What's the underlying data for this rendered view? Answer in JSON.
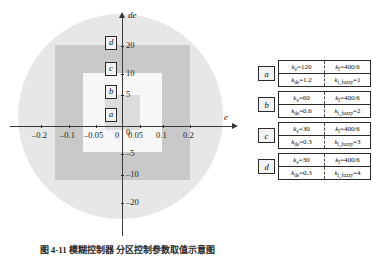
{
  "chart_data": {
    "type": "scatter",
    "title": "",
    "xlabel": "e",
    "ylabel": "de",
    "xlim": [
      -0.25,
      0.25
    ],
    "ylim": [
      -25,
      25
    ],
    "grid": false,
    "legend_position": "right",
    "x_ticks": [
      "-0.2",
      "-0.1",
      "-0.05",
      "0",
      "0.05",
      "0.1",
      "0.2"
    ],
    "x_tick_values": [
      -0.2,
      -0.1,
      -0.05,
      0,
      0.05,
      0.1,
      0.2
    ],
    "y_ticks": [
      "20",
      "10",
      "5",
      "0",
      "-5",
      "-10",
      "-20"
    ],
    "y_tick_values": [
      20,
      10,
      5,
      0,
      -5,
      -10,
      -20
    ],
    "regions": [
      {
        "label": "a",
        "shape": "rectangle",
        "x_range": [
          -0.05,
          0.05
        ],
        "y_range": [
          -5,
          5
        ],
        "color": "#dcdcdc"
      },
      {
        "label": "b",
        "shape": "rectangle",
        "x_range": [
          -0.1,
          0.1
        ],
        "y_range": [
          -10,
          10
        ],
        "color": "#f7f7f7"
      },
      {
        "label": "c",
        "shape": "rectangle",
        "x_range": [
          -0.2,
          0.2
        ],
        "y_range": [
          -20,
          20
        ],
        "color": "#c9c9c9"
      },
      {
        "label": "d",
        "shape": "circle",
        "x_range": [
          -0.25,
          0.25
        ],
        "y_range": [
          -25,
          25
        ],
        "color": "#e7e7e7"
      }
    ],
    "series": [
      {
        "name": "a",
        "k_e": "120",
        "k_I": "400/6",
        "k_de": "1.2",
        "k_i_fuzzy": "1"
      },
      {
        "name": "b",
        "k_e": "60",
        "k_I": "400/6",
        "k_de": "0.6",
        "k_i_fuzzy": "2"
      },
      {
        "name": "c",
        "k_e": "30",
        "k_I": "400/6",
        "k_de": "0.3",
        "k_i_fuzzy": "3"
      },
      {
        "name": "d",
        "k_e": "30",
        "k_I": "400/6",
        "k_de": "0.3",
        "k_i_fuzzy": "4"
      }
    ]
  },
  "axes": {
    "x_label": "e",
    "y_label": "de",
    "x_ticks": [
      {
        "text": "-0.2",
        "left": 32,
        "tickx": 41
      },
      {
        "text": "-0.1",
        "left": 60,
        "tickx": 69
      },
      {
        "text": "-0.05",
        "left": 84,
        "tickx": 96
      },
      {
        "text": "0",
        "left": 115,
        "tickx": 122
      },
      {
        "text": "0.05",
        "left": 128,
        "tickx": 140
      },
      {
        "text": "0.1",
        "left": 156,
        "tickx": 163
      },
      {
        "text": "0.2",
        "left": 183,
        "tickx": 190
      }
    ],
    "y_ticks": [
      {
        "text": "20",
        "top": 41,
        "ticky": 46
      },
      {
        "text": "10",
        "top": 69,
        "ticky": 74
      },
      {
        "text": "5",
        "top": 90,
        "ticky": 95
      },
      {
        "text": "0",
        "top": 128,
        "ticky": 126
      },
      {
        "text": "-5",
        "top": 149,
        "ticky": 154
      },
      {
        "text": "-10",
        "top": 170,
        "ticky": 175
      },
      {
        "text": "-20",
        "top": 198,
        "ticky": 203
      }
    ]
  },
  "region_badges": [
    {
      "label": "d",
      "left": 105,
      "top": 36
    },
    {
      "label": "c",
      "left": 105,
      "top": 62
    },
    {
      "label": "b",
      "left": 105,
      "top": 85
    },
    {
      "label": "a",
      "left": 105,
      "top": 108
    }
  ],
  "legend": {
    "rows": [
      {
        "key": "a",
        "c11": "k_e=120",
        "c12": "k_I=400/6",
        "c21": "k_de=1.2",
        "c22": "k_i_fuzzy=1"
      },
      {
        "key": "b",
        "c11": "k_e=60",
        "c12": "k_I=400/6",
        "c21": "k_de=0.6",
        "c22": "k_i_fuzzy=2"
      },
      {
        "key": "c",
        "c11": "k_e=30",
        "c12": "k_I=400/6",
        "c21": "k_de=0.3",
        "c22": "k_i_fuzzy=3"
      },
      {
        "key": "d",
        "c11": "k_e=30",
        "c12": "k_I=400/6",
        "c21": "k_de=0.3",
        "c22": "k_i_fuzzy=4"
      }
    ]
  },
  "caption": {
    "text": "图 4-11  模糊控制器 分区控制参数取值示意图"
  },
  "colors": {
    "region_d": "#e7e7e7",
    "region_c": "#c9c9c9",
    "region_b": "#f7f7f7",
    "region_a": "#dcdcdc",
    "axis": "#3a3a3a",
    "text": "#1c1c1c"
  }
}
